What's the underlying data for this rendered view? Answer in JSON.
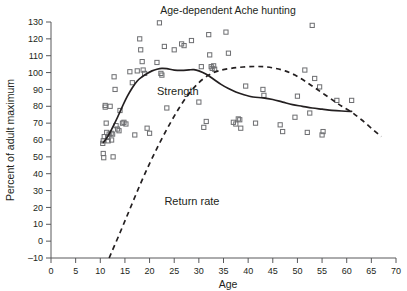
{
  "chart_data": {
    "type": "scatter",
    "title": "Age-dependent Ache hunting",
    "xlabel": "Age",
    "ylabel": "Percent of adult maximum",
    "xlim": [
      0,
      70
    ],
    "ylim": [
      -10,
      130
    ],
    "xticks": [
      0,
      5,
      10,
      15,
      20,
      25,
      30,
      35,
      40,
      45,
      50,
      55,
      60,
      65,
      70
    ],
    "yticks": [
      -10,
      0,
      10,
      20,
      30,
      40,
      50,
      60,
      70,
      80,
      90,
      100,
      110,
      120,
      130
    ],
    "xtick_labels": [
      "0",
      "5",
      "10",
      "15",
      "20",
      "25",
      "30",
      "35",
      "40",
      "45",
      "50",
      "55",
      "60",
      "65",
      "70"
    ],
    "ytick_labels": [
      "–10",
      "0",
      "10",
      "20",
      "30",
      "40",
      "50",
      "60",
      "70",
      "80",
      "90",
      "100",
      "110",
      "120",
      "130"
    ],
    "grid": false,
    "legend_position": "inline-annotation",
    "annotations": [
      {
        "label": "Strength",
        "x": 21.5,
        "y": 86.5
      },
      {
        "label": "Return rate",
        "x": 23.0,
        "y": 21.5
      }
    ],
    "series": [
      {
        "name": "Strength",
        "style": "solid-line",
        "points": [
          [
            10.6,
            58.5
          ],
          [
            11.5,
            62.0
          ],
          [
            12.5,
            67.5
          ],
          [
            13.5,
            73.5
          ],
          [
            14.5,
            80.0
          ],
          [
            15.5,
            86.0
          ],
          [
            16.5,
            91.0
          ],
          [
            17.5,
            95.0
          ],
          [
            18.5,
            97.5
          ],
          [
            19.5,
            99.5
          ],
          [
            20.5,
            101.0
          ],
          [
            21.5,
            102.0
          ],
          [
            22.5,
            102.5
          ],
          [
            23.5,
            102.3
          ],
          [
            25.0,
            101.5
          ],
          [
            26.5,
            101.3
          ],
          [
            28.0,
            101.6
          ],
          [
            29.0,
            101.7
          ],
          [
            30.0,
            101.0
          ],
          [
            31.5,
            99.0
          ],
          [
            33.0,
            96.0
          ],
          [
            34.5,
            93.0
          ],
          [
            36.0,
            90.5
          ],
          [
            37.5,
            88.5
          ],
          [
            39.0,
            87.0
          ],
          [
            41.0,
            85.5
          ],
          [
            43.0,
            85.0
          ],
          [
            45.0,
            84.0
          ],
          [
            47.0,
            82.5
          ],
          [
            49.0,
            81.0
          ],
          [
            51.0,
            80.0
          ],
          [
            53.0,
            79.0
          ],
          [
            55.0,
            78.3
          ],
          [
            57.0,
            77.6
          ],
          [
            59.0,
            77.2
          ],
          [
            61.0,
            77.0
          ]
        ]
      },
      {
        "name": "Return rate",
        "style": "dashed-line",
        "points": [
          [
            11.8,
            -10.0
          ],
          [
            14.0,
            5.0
          ],
          [
            16.0,
            19.0
          ],
          [
            18.0,
            33.0
          ],
          [
            20.0,
            46.0
          ],
          [
            22.0,
            58.0
          ],
          [
            24.0,
            69.0
          ],
          [
            26.0,
            79.0
          ],
          [
            28.0,
            87.5
          ],
          [
            30.0,
            94.0
          ],
          [
            32.0,
            98.5
          ],
          [
            34.0,
            101.0
          ],
          [
            36.5,
            102.5
          ],
          [
            39.0,
            103.3
          ],
          [
            41.5,
            103.6
          ],
          [
            43.5,
            103.4
          ],
          [
            45.5,
            102.5
          ],
          [
            47.5,
            101.0
          ],
          [
            49.5,
            98.5
          ],
          [
            51.5,
            95.0
          ],
          [
            53.5,
            91.0
          ],
          [
            55.5,
            87.0
          ],
          [
            57.5,
            83.0
          ],
          [
            59.0,
            80.0
          ],
          [
            61.0,
            76.5
          ],
          [
            63.0,
            72.0
          ],
          [
            65.0,
            67.0
          ],
          [
            67.0,
            62.0
          ]
        ]
      }
    ],
    "scatter_points": [
      [
        10.5,
        58.0
      ],
      [
        10.6,
        59.5
      ],
      [
        10.6,
        52.0
      ],
      [
        10.7,
        49.5
      ],
      [
        10.8,
        62.0
      ],
      [
        11.0,
        80.5
      ],
      [
        11.0,
        79.5
      ],
      [
        11.2,
        70.0
      ],
      [
        11.3,
        64.5
      ],
      [
        11.5,
        61.5
      ],
      [
        11.6,
        59.5
      ],
      [
        11.8,
        63.5
      ],
      [
        12.0,
        80.0
      ],
      [
        12.2,
        64.0
      ],
      [
        12.3,
        60.0
      ],
      [
        12.5,
        63.5
      ],
      [
        12.6,
        50.0
      ],
      [
        12.8,
        97.5
      ],
      [
        13.0,
        90.0
      ],
      [
        13.2,
        68.5
      ],
      [
        13.5,
        66.5
      ],
      [
        13.8,
        65.5
      ],
      [
        14.0,
        77.5
      ],
      [
        14.5,
        70.0
      ],
      [
        14.8,
        70.5
      ],
      [
        15.2,
        69.5
      ],
      [
        16.0,
        100.5
      ],
      [
        16.5,
        94.0
      ],
      [
        17.0,
        63.0
      ],
      [
        17.5,
        101.0
      ],
      [
        18.0,
        120.0
      ],
      [
        18.2,
        113.5
      ],
      [
        18.5,
        106.5
      ],
      [
        18.7,
        101.5
      ],
      [
        19.0,
        99.5
      ],
      [
        19.5,
        67.0
      ],
      [
        20.0,
        64.0
      ],
      [
        21.5,
        106.0
      ],
      [
        22.0,
        129.5
      ],
      [
        22.3,
        99.5
      ],
      [
        22.5,
        98.5
      ],
      [
        23.0,
        115.5
      ],
      [
        23.5,
        79.0
      ],
      [
        25.0,
        113.5
      ],
      [
        26.5,
        117.0
      ],
      [
        27.0,
        116.0
      ],
      [
        28.5,
        119.0
      ],
      [
        30.0,
        82.5
      ],
      [
        30.5,
        103.5
      ],
      [
        31.0,
        67.5
      ],
      [
        31.5,
        71.0
      ],
      [
        32.0,
        122.5
      ],
      [
        32.2,
        110.5
      ],
      [
        32.5,
        103.5
      ],
      [
        32.7,
        102.5
      ],
      [
        33.0,
        104.0
      ],
      [
        33.2,
        102.0
      ],
      [
        35.5,
        124.0
      ],
      [
        36.0,
        111.5
      ],
      [
        37.0,
        70.5
      ],
      [
        37.5,
        69.5
      ],
      [
        38.0,
        72.5
      ],
      [
        38.3,
        72.0
      ],
      [
        38.5,
        67.0
      ],
      [
        39.5,
        92.0
      ],
      [
        41.5,
        70.0
      ],
      [
        43.0,
        90.0
      ],
      [
        43.2,
        86.5
      ],
      [
        46.5,
        69.0
      ],
      [
        47.0,
        65.0
      ],
      [
        49.5,
        73.5
      ],
      [
        50.0,
        86.0
      ],
      [
        51.5,
        101.5
      ],
      [
        52.0,
        64.5
      ],
      [
        52.5,
        76.0
      ],
      [
        53.0,
        128.0
      ],
      [
        53.5,
        96.5
      ],
      [
        54.5,
        91.5
      ],
      [
        55.0,
        63.0
      ],
      [
        55.2,
        65.0
      ],
      [
        58.0,
        83.5
      ],
      [
        61.0,
        83.5
      ]
    ]
  },
  "colors": {
    "text": "#231f20",
    "axis": "#58595b",
    "marker_stroke": "#6d6e71",
    "curve": "#231f20",
    "background": "#ffffff"
  }
}
